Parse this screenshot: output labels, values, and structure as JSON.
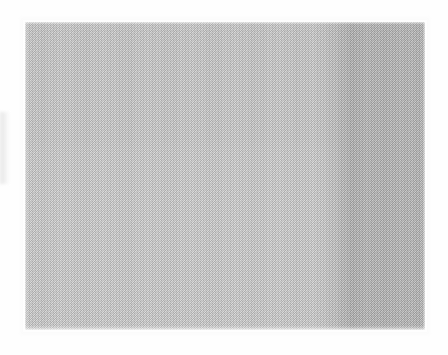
{
  "document": {
    "kind": "scanned-page",
    "title": "",
    "visible_text": "",
    "notes": ""
  },
  "canvas": {
    "width": 448,
    "height": 355,
    "background_color": "#fefefe"
  },
  "scan": {
    "panel": {
      "name": "scanned-grey-panel",
      "left": 25,
      "top": 22,
      "width": 400,
      "height": 308,
      "texture": "halftone-dither"
    },
    "regions": [
      {
        "name": "light-region",
        "label": "",
        "color": "#c8c8c8",
        "from_x": 25,
        "to_x": 318
      },
      {
        "name": "dark-band",
        "label": "",
        "color": "#b0b0b0",
        "from_x": 322,
        "to_x": 425
      }
    ],
    "artifacts": [
      {
        "name": "left-edge-smudge",
        "label": "",
        "color": "#e8e8e8",
        "left": 0,
        "top": 112,
        "width": 9,
        "height": 72
      }
    ]
  }
}
